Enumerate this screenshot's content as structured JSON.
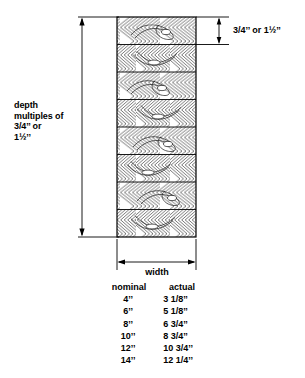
{
  "diagram": {
    "title_role": "glulam-beam-cross-section-diagram",
    "depth_label": "depth\nmultiples of\n3/4’’ or\n1½’’",
    "lamination_label": "3/4’’ or 1½’’",
    "width_label": "width",
    "line_color": "#000000",
    "background_color": "#ffffff",
    "beam": {
      "lamination_count": 8,
      "grain_pattern": "chevron-wood-grain"
    }
  },
  "table": {
    "headers": {
      "nominal": "nominal",
      "actual": "actual"
    },
    "rows": [
      {
        "nominal": "4’’",
        "actual": "3 1/8’’"
      },
      {
        "nominal": "6’’",
        "actual": "5 1/8’’"
      },
      {
        "nominal": "8’’",
        "actual": "6 3/4’’"
      },
      {
        "nominal": "10’’",
        "actual": "8 3/4’’"
      },
      {
        "nominal": "12’’",
        "actual": "10 3/4’’"
      },
      {
        "nominal": "14’’",
        "actual": "12 1/4’’"
      }
    ]
  }
}
